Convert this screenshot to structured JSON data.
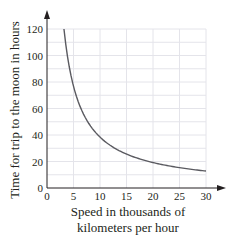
{
  "chart_data": {
    "type": "line",
    "title": "",
    "xlabel": "Speed in thousands of kilometers per hour",
    "xlabel_lines": [
      "Speed in thousands of",
      "kilometers per hour"
    ],
    "ylabel": "Time for trip to the moon in hours",
    "xlim": [
      0,
      30
    ],
    "ylim": [
      0,
      120
    ],
    "x_ticks": [
      0,
      5,
      10,
      15,
      20,
      25,
      30
    ],
    "y_ticks": [
      0,
      20,
      40,
      60,
      80,
      100,
      120
    ],
    "grid": true,
    "grid_x_step": 5,
    "grid_y_step": 10,
    "legend": null,
    "series": [
      {
        "name": "Time vs. speed",
        "color": "#5a5a60",
        "x": [
          3.2,
          4,
          5,
          6,
          7,
          8,
          10,
          12,
          15,
          18,
          20,
          25,
          30
        ],
        "y": [
          120,
          96,
          76.8,
          64,
          54.9,
          48,
          38.4,
          32,
          25.6,
          21.3,
          19.2,
          15.36,
          12.8
        ]
      }
    ]
  }
}
